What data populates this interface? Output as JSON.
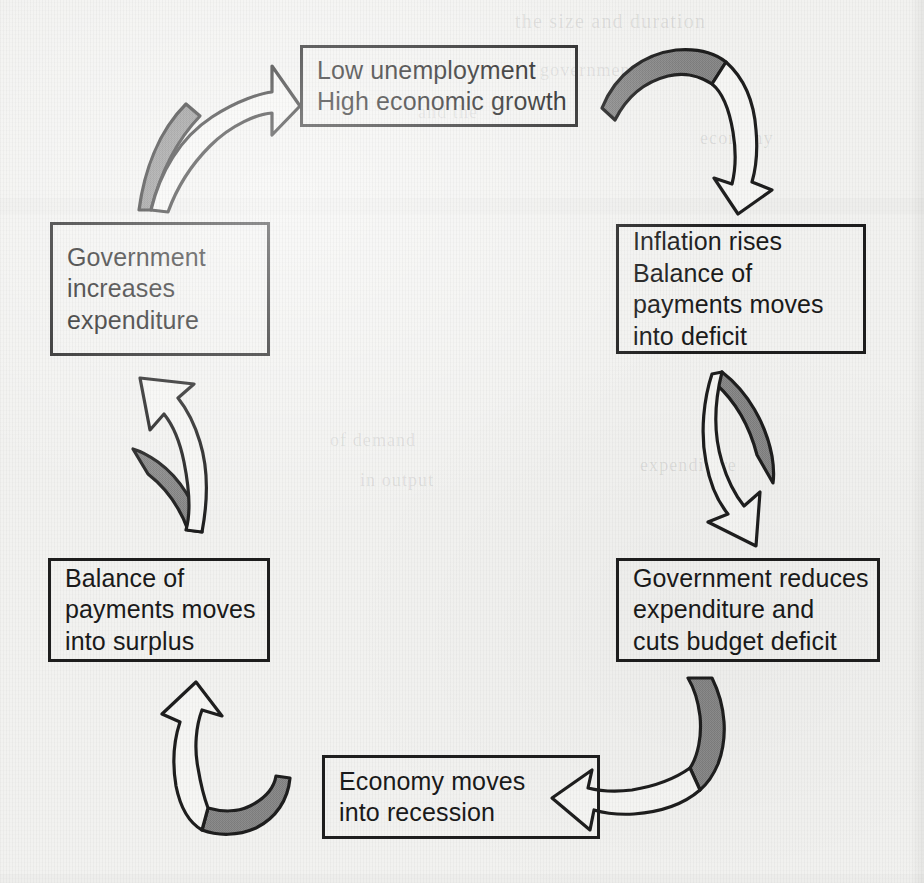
{
  "diagram": {
    "type": "cycle",
    "background_color": "#f2f2f0",
    "box_border_color": "#1e1e1e",
    "arrow_outline_color": "#1e1e1e",
    "arrow_shade_color": "#8a8a8a",
    "text_color": "#1a1a1a",
    "nodes": [
      {
        "id": "low-unemployment",
        "position": "top",
        "text": "Low unemployment\nHigh economic growth"
      },
      {
        "id": "inflation-rises",
        "position": "right-top",
        "text": "Inflation rises\nBalance of\npayments moves\ninto deficit"
      },
      {
        "id": "government-reduces-expenditure",
        "position": "right-bottom",
        "text": "Government reduces\nexpenditure and\ncuts budget deficit"
      },
      {
        "id": "economy-recession",
        "position": "bottom",
        "text": "Economy moves\ninto recession"
      },
      {
        "id": "balance-of-payments-surplus",
        "position": "left-bottom",
        "text": "Balance of\npayments moves\ninto surplus"
      },
      {
        "id": "government-increases-expenditure",
        "position": "left-top",
        "text": "Government\nincreases\nexpenditure"
      }
    ],
    "arrows": [
      {
        "id": "arrow-top-right",
        "from": "low-unemployment",
        "to": "inflation-rises",
        "direction": "clockwise"
      },
      {
        "id": "arrow-right",
        "from": "inflation-rises",
        "to": "government-reduces-expenditure",
        "direction": "clockwise"
      },
      {
        "id": "arrow-bottom-right",
        "from": "government-reduces-expenditure",
        "to": "economy-recession",
        "direction": "clockwise"
      },
      {
        "id": "arrow-bottom-left",
        "from": "economy-recession",
        "to": "balance-of-payments-surplus",
        "direction": "clockwise"
      },
      {
        "id": "arrow-left",
        "from": "balance-of-payments-surplus",
        "to": "government-increases-expenditure",
        "direction": "clockwise"
      },
      {
        "id": "arrow-top-left",
        "from": "government-increases-expenditure",
        "to": "low-unemployment",
        "direction": "clockwise"
      }
    ]
  },
  "page_artifacts": {
    "bleed_lines": [
      "the size and duration",
      "were particularly",
      "government",
      "and the",
      "economy",
      "of demand",
      "in output",
      "expenditure"
    ]
  }
}
